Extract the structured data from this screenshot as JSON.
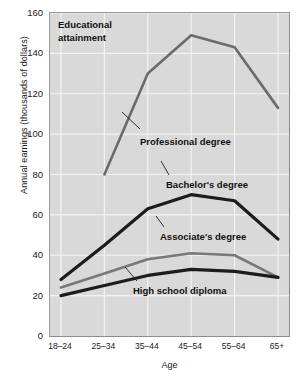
{
  "chart_data": {
    "type": "line",
    "title": "Educational attainment",
    "xlabel": "Age",
    "ylabel": "Annual earnings (thousands of dollars)",
    "categories": [
      "18–24",
      "25–34",
      "35–44",
      "45–54",
      "55–64",
      "65+"
    ],
    "ylim": [
      0,
      160
    ],
    "yticks": [
      0,
      20,
      40,
      60,
      80,
      100,
      120,
      140,
      160
    ],
    "grid": true,
    "legend": "inline-annotations",
    "series": [
      {
        "name": "Professional degree",
        "color": "#6b6b6b",
        "values": [
          null,
          80,
          130,
          149,
          143,
          113
        ]
      },
      {
        "name": "Bachelor's degree",
        "color": "#1c1c1c",
        "values": [
          28,
          45,
          63,
          70,
          67,
          48
        ]
      },
      {
        "name": "Associate's degree",
        "color": "#787878",
        "values": [
          24,
          31,
          38,
          41,
          40,
          29
        ]
      },
      {
        "name": "High school diploma",
        "color": "#1c1c1c",
        "values": [
          20,
          25,
          30,
          33,
          32,
          29
        ]
      }
    ]
  },
  "annotations": {
    "title": "Educational\nattainment",
    "title_line1": "Educational",
    "title_line2": "attainment",
    "professional": "Professional degree",
    "bachelors": "Bachelor's degree",
    "associates": "Associate's degree",
    "highschool": "High school diploma"
  },
  "axes": {
    "y_label": "Annual earnings (thousands of dollars)",
    "x_label": "Age"
  }
}
